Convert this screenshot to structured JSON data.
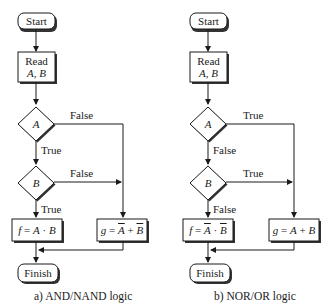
{
  "flowcharts": [
    {
      "id": "a",
      "caption": "a) AND/NAND logic",
      "start": "Start",
      "read": {
        "line1": "Read",
        "line2": "A, B"
      },
      "decision_a": {
        "var": "A",
        "down_label": "True",
        "right_label": "False"
      },
      "decision_b": {
        "var": "B",
        "down_label": "True",
        "right_label": "False"
      },
      "left_output": {
        "lhs": "f",
        "eq": " = ",
        "parts": [
          {
            "text": "A",
            "overline": false
          },
          {
            "text": " · ",
            "overline": false
          },
          {
            "text": "B",
            "overline": false
          }
        ]
      },
      "right_output": {
        "lhs": "g",
        "eq": " = ",
        "parts": [
          {
            "text": "A",
            "overline": true
          },
          {
            "text": " + ",
            "overline": false
          },
          {
            "text": "B",
            "overline": true
          }
        ]
      },
      "finish": "Finish"
    },
    {
      "id": "b",
      "caption": "b) NOR/OR logic",
      "start": "Start",
      "read": {
        "line1": "Read",
        "line2": "A, B"
      },
      "decision_a": {
        "var": "A",
        "down_label": "False",
        "right_label": "True"
      },
      "decision_b": {
        "var": "B",
        "down_label": "False",
        "right_label": "True"
      },
      "left_output": {
        "lhs": "f",
        "eq": " = ",
        "parts": [
          {
            "text": "A",
            "overline": true
          },
          {
            "text": " · ",
            "overline": false
          },
          {
            "text": "B",
            "overline": true
          }
        ]
      },
      "right_output": {
        "lhs": "g",
        "eq": " = ",
        "parts": [
          {
            "text": "A",
            "overline": false
          },
          {
            "text": " + ",
            "overline": false
          },
          {
            "text": "B",
            "overline": false
          }
        ]
      },
      "finish": "Finish"
    }
  ]
}
